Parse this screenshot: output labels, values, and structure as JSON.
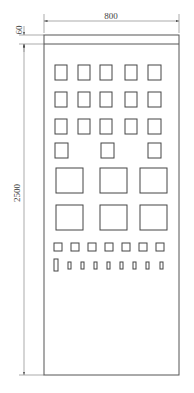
{
  "diagram": {
    "type": "electrical cabinet front elevation",
    "dimensions": {
      "width_label": "800",
      "height_label": "2500",
      "top_strip_label": "60"
    },
    "panel": {
      "x": 44,
      "y": 35,
      "w": 135,
      "h": 340,
      "top_strip_h": 9
    },
    "components": {
      "row1": {
        "count": 5,
        "type": "small square meter"
      },
      "row2": {
        "count": 5,
        "type": "small square meter"
      },
      "row3": {
        "count": 5,
        "type": "small square meter"
      },
      "row4": {
        "count": 3,
        "type": "small square meter"
      },
      "row5": {
        "count": 3,
        "type": "large square meter"
      },
      "row6": {
        "count": 3,
        "type": "large square meter"
      },
      "row7": {
        "count": 7,
        "type": "indicator square"
      },
      "row8": {
        "count": 9,
        "type": "switch / rectangular button",
        "note": "first is taller"
      }
    }
  }
}
